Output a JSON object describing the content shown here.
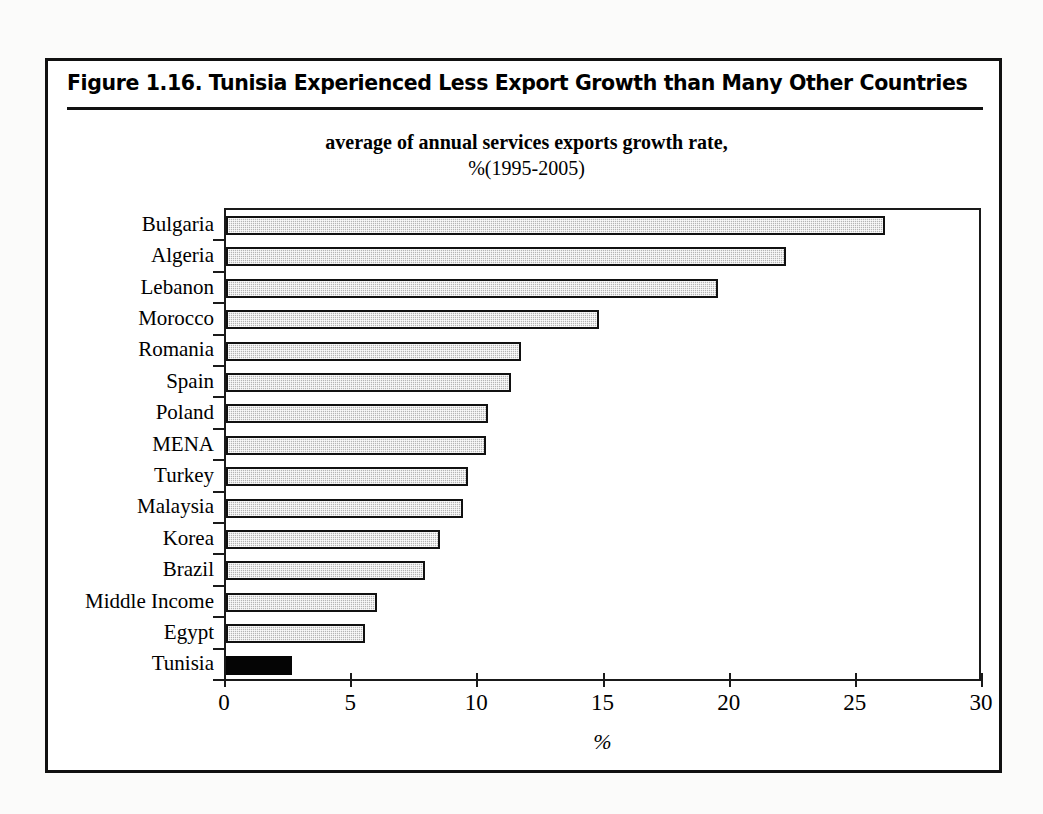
{
  "figure": {
    "title": "Figure 1.16.  Tunisia Experienced Less Export Growth than Many Other Countries"
  },
  "chart_data": {
    "type": "bar",
    "orientation": "horizontal",
    "title": "average of annual services exports growth rate,",
    "subtitle": "%(1995-2005)",
    "xlabel": "%",
    "ylabel": "",
    "xlim": [
      0,
      30
    ],
    "xticks": [
      0,
      5,
      10,
      15,
      20,
      25,
      30
    ],
    "xticklabels": [
      "0",
      "5",
      "10",
      "15",
      "20",
      "25",
      "30"
    ],
    "grid": false,
    "legend": false,
    "categories": [
      "Bulgaria",
      "Algeria",
      "Lebanon",
      "Morocco",
      "Romania",
      "Spain",
      "Poland",
      "MENA",
      "Turkey",
      "Malaysia",
      "Korea",
      "Brazil",
      "Middle Income",
      "Egypt",
      "Tunisia"
    ],
    "values": [
      26.1,
      22.2,
      19.5,
      14.8,
      11.7,
      11.3,
      10.4,
      10.3,
      9.6,
      9.4,
      8.5,
      7.9,
      6.0,
      5.5,
      2.6
    ],
    "highlight_category": "Tunisia",
    "colors": {
      "bar_fill": "#b5b5b5",
      "bar_border": "#111111",
      "highlight_fill": "#050505",
      "axis": "#1a1a1a",
      "frame": "#111111",
      "background": "#ffffff"
    }
  }
}
